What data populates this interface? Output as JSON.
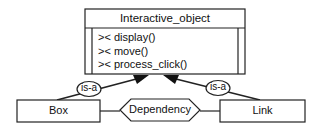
{
  "diagram": {
    "type": "class-diagram",
    "class": {
      "name": "Interactive_object",
      "methods": [
        {
          "marker": "><",
          "name": "display()"
        },
        {
          "marker": "><",
          "name": "move()"
        },
        {
          "marker": "><",
          "name": "process_click()"
        }
      ]
    },
    "subclasses": [
      {
        "name": "Box",
        "relation": "is-a"
      },
      {
        "name": "Link",
        "relation": "is-a"
      }
    ],
    "association": {
      "label": "Dependency",
      "from": "Box",
      "to": "Link"
    }
  }
}
